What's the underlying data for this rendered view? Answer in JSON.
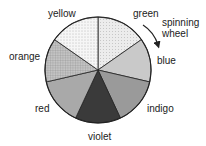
{
  "diagram": {
    "center": [
      98,
      70
    ],
    "radius": 53,
    "segments": [
      {
        "name": "green",
        "fill": "#ededed",
        "pattern": "dots-light",
        "start": 0,
        "end": 55
      },
      {
        "name": "blue",
        "fill": "#c9c9c9",
        "pattern": "none",
        "start": 55,
        "end": 103
      },
      {
        "name": "indigo",
        "fill": "#9a9a9a",
        "pattern": "none",
        "start": 103,
        "end": 155
      },
      {
        "name": "violet",
        "fill": "#3a3a3a",
        "pattern": "none",
        "start": 155,
        "end": 205
      },
      {
        "name": "red",
        "fill": "#a9a9a9",
        "pattern": "none",
        "start": 205,
        "end": 257
      },
      {
        "name": "orange",
        "fill": "#bdbdbd",
        "pattern": "grid",
        "start": 257,
        "end": 305
      },
      {
        "name": "yellow",
        "fill": "#f4f4f4",
        "pattern": "dots",
        "start": 305,
        "end": 360
      }
    ],
    "labels": {
      "green": "green",
      "blue": "blue",
      "indigo": "indigo",
      "violet": "violet",
      "red": "red",
      "orange": "orange",
      "yellow": "yellow",
      "annotation_line1": "spinning",
      "annotation_line2": "wheel"
    }
  }
}
